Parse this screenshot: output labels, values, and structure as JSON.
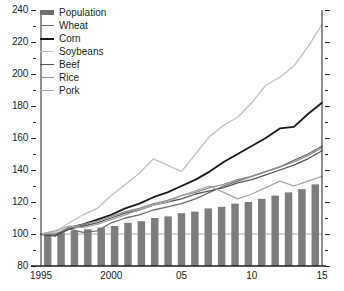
{
  "chart_data": {
    "type": "line",
    "title": "",
    "subtitle": "",
    "xlabel": "",
    "ylabel": "",
    "xlim": [
      1995,
      2015
    ],
    "ylim": [
      80,
      240
    ],
    "ytick_step": 20,
    "yminor_step": 10,
    "grid": false,
    "reference_line": 100,
    "legend_position": "top-left",
    "x": [
      1995,
      1996,
      1997,
      1998,
      1999,
      2000,
      2001,
      2002,
      2003,
      2004,
      2005,
      2006,
      2007,
      2008,
      2009,
      2010,
      2011,
      2012,
      2013,
      2014,
      2015
    ],
    "x_tick_labels": [
      "1995",
      "2000",
      "05",
      "10",
      "15"
    ],
    "x_tick_values": [
      1995,
      2000,
      2005,
      2010,
      2015
    ],
    "y_tick_labels": [
      "80",
      "100",
      "120",
      "140",
      "160",
      "180",
      "200",
      "220",
      "240"
    ],
    "y_tick_values": [
      80,
      100,
      120,
      140,
      160,
      180,
      200,
      220,
      240
    ],
    "series": [
      {
        "name": "Population",
        "render": "bar",
        "color": "#7d7d7d",
        "values": [
          100,
          101,
          102,
          103,
          104,
          105,
          107,
          108,
          110,
          111,
          113,
          114,
          116,
          117,
          119,
          120,
          122,
          124,
          126,
          128,
          131
        ]
      },
      {
        "name": "Wheat",
        "render": "line",
        "color": "#6e6e6e",
        "width": 1.3,
        "values": [
          100,
          99,
          103,
          101,
          102,
          107,
          110,
          112,
          115,
          117,
          119,
          122,
          126,
          130,
          133,
          136,
          139,
          142,
          146,
          150,
          155
        ]
      },
      {
        "name": "Corn",
        "render": "line",
        "color": "#1a1a1a",
        "width": 1.8,
        "values": [
          100,
          99,
          104,
          106,
          109,
          112,
          116,
          119,
          123,
          126,
          130,
          134,
          139,
          145,
          150,
          155,
          160,
          166,
          167,
          175,
          182
        ]
      },
      {
        "name": "Soybeans",
        "render": "line",
        "color": "#c2c2c2",
        "width": 1.3,
        "values": [
          100,
          101,
          107,
          112,
          116,
          124,
          131,
          138,
          147,
          143,
          139,
          150,
          161,
          168,
          173,
          182,
          193,
          198,
          205,
          217,
          231
        ]
      },
      {
        "name": "Beef",
        "render": "line",
        "color": "#565656",
        "width": 1.3,
        "values": [
          100,
          99,
          103,
          105,
          107,
          110,
          113,
          115,
          118,
          120,
          122,
          125,
          127,
          129,
          132,
          134,
          137,
          140,
          143,
          147,
          152
        ]
      },
      {
        "name": "Rice",
        "render": "line",
        "color": "#8f8f8f",
        "width": 1.3,
        "values": [
          100,
          100,
          104,
          106,
          108,
          111,
          114,
          116,
          119,
          121,
          124,
          126,
          129,
          131,
          134,
          136,
          139,
          142,
          145,
          149,
          154
        ]
      },
      {
        "name": "Pork",
        "render": "line",
        "color": "#a8a8a8",
        "width": 1.3,
        "values": [
          100,
          102,
          105,
          104,
          106,
          109,
          112,
          115,
          118,
          120,
          124,
          127,
          130,
          126,
          122,
          125,
          129,
          133,
          130,
          133,
          136
        ]
      }
    ]
  },
  "legend": {
    "items": [
      {
        "label": "Population",
        "style": "bar",
        "color": "#6f6f6f"
      },
      {
        "label": "Wheat",
        "style": "line",
        "color": "#6e6e6e"
      },
      {
        "label": "Corn",
        "style": "line",
        "color": "#1a1a1a"
      },
      {
        "label": "Soybeans",
        "style": "line",
        "color": "#c2c2c2"
      },
      {
        "label": "Beef",
        "style": "line",
        "color": "#565656"
      },
      {
        "label": "Rice",
        "style": "line",
        "color": "#8f8f8f"
      },
      {
        "label": "Pork",
        "style": "line",
        "color": "#a8a8a8"
      }
    ]
  },
  "colors": {
    "axis": "#231f20",
    "text": "#231f20",
    "bar": "#7d7d7d",
    "background": "#ffffff"
  }
}
